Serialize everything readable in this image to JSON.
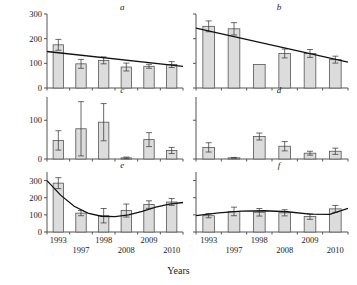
{
  "figure": {
    "ylabel": "Chl+Pheo, µg/g dry matter",
    "xlabel": "Years"
  },
  "chart_data": [
    {
      "type": "bar",
      "panel": "a",
      "title": "a",
      "categories": [
        "1993",
        "1997",
        "1998",
        "2008",
        "2009",
        "2010"
      ],
      "values": [
        175,
        98,
        112,
        85,
        88,
        95
      ],
      "errors": [
        22,
        18,
        14,
        16,
        8,
        12
      ],
      "trendline": {
        "type": "linear",
        "x_start": 0,
        "y_start": 148,
        "x_end": 1,
        "y_end": 88
      },
      "xlabel": "",
      "ylabel": "",
      "ylim": [
        0,
        300
      ],
      "yticks": [
        0,
        100,
        200,
        300
      ],
      "ytick_labels": [
        "0",
        "100",
        "200",
        "300"
      ],
      "grid": false,
      "legend": "none"
    },
    {
      "type": "bar",
      "panel": "b",
      "title": "b",
      "categories": [
        "1993",
        "1997",
        "1998",
        "2008",
        "2009",
        "2010"
      ],
      "values": [
        250,
        240,
        95,
        140,
        140,
        115
      ],
      "errors": [
        22,
        25,
        0,
        18,
        16,
        14
      ],
      "trendline": {
        "type": "linear",
        "x_start": 0,
        "y_start": 243,
        "x_end": 1,
        "y_end": 105
      },
      "xlabel": "",
      "ylabel": "",
      "ylim": [
        0,
        300
      ],
      "yticks": [
        0,
        100,
        200,
        300
      ],
      "ytick_labels": [
        "",
        "",
        "",
        ""
      ],
      "grid": false,
      "legend": "none"
    },
    {
      "type": "bar",
      "panel": "c",
      "title": "c",
      "categories": [
        "1993",
        "1997",
        "1998",
        "2008",
        "2009",
        "2010"
      ],
      "values": [
        48,
        78,
        95,
        3,
        50,
        22
      ],
      "errors": [
        25,
        70,
        48,
        2,
        18,
        8
      ],
      "trendline": null,
      "xlabel": "",
      "ylabel": "",
      "ylim": [
        0,
        160
      ],
      "yticks": [
        0,
        100
      ],
      "ytick_labels": [
        "0",
        "100"
      ],
      "grid": false,
      "legend": "none"
    },
    {
      "type": "bar",
      "panel": "d",
      "title": "d",
      "categories": [
        "1993",
        "1997",
        "1998",
        "2008",
        "2009",
        "2010"
      ],
      "values": [
        30,
        3,
        58,
        33,
        15,
        20
      ],
      "errors": [
        12,
        1,
        9,
        12,
        5,
        8
      ],
      "trendline": null,
      "xlabel": "",
      "ylabel": "",
      "ylim": [
        0,
        160
      ],
      "yticks": [
        0,
        100
      ],
      "ytick_labels": [
        "",
        ""
      ],
      "grid": false,
      "legend": "none"
    },
    {
      "type": "bar",
      "panel": "e",
      "title": "e",
      "categories": [
        "1993",
        "1997",
        "1998",
        "2008",
        "2009",
        "2010"
      ],
      "values": [
        285,
        110,
        95,
        125,
        160,
        175
      ],
      "errors": [
        32,
        15,
        42,
        38,
        22,
        20
      ],
      "trendline": {
        "type": "polynomial",
        "points": [
          [
            0.0,
            300
          ],
          [
            0.1,
            215
          ],
          [
            0.2,
            150
          ],
          [
            0.3,
            110
          ],
          [
            0.4,
            92
          ],
          [
            0.5,
            90
          ],
          [
            0.6,
            100
          ],
          [
            0.7,
            120
          ],
          [
            0.8,
            145
          ],
          [
            0.9,
            163
          ],
          [
            1.0,
            172
          ]
        ]
      },
      "xlabel": "",
      "ylabel": "",
      "ylim": [
        0,
        350
      ],
      "yticks": [
        0,
        100,
        200,
        300
      ],
      "ytick_labels": [
        "0",
        "100",
        "200",
        "300"
      ],
      "grid": false,
      "legend": "none"
    },
    {
      "type": "bar",
      "panel": "f",
      "title": "f",
      "categories": [
        "1993",
        "1997",
        "1998",
        "2008",
        "2009",
        "2010"
      ],
      "values": [
        95,
        120,
        115,
        112,
        90,
        135
      ],
      "errors": [
        12,
        25,
        22,
        18,
        16,
        20
      ],
      "trendline": {
        "type": "polynomial",
        "points": [
          [
            0.0,
            95
          ],
          [
            0.15,
            112
          ],
          [
            0.3,
            122
          ],
          [
            0.45,
            124
          ],
          [
            0.6,
            118
          ],
          [
            0.75,
            104
          ],
          [
            0.88,
            103
          ],
          [
            1.0,
            138
          ]
        ]
      },
      "xlabel": "",
      "ylabel": "",
      "ylim": [
        0,
        350
      ],
      "yticks": [
        0,
        100,
        200,
        300
      ],
      "ytick_labels": [
        "",
        "",
        "",
        ""
      ],
      "grid": false,
      "legend": "none"
    }
  ]
}
